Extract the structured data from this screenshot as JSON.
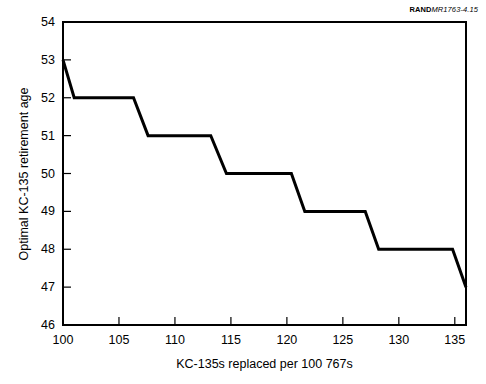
{
  "figure_id": {
    "brand": "RAND",
    "number": "MR1763-4.15"
  },
  "chart_data": {
    "type": "line",
    "title": "",
    "subtitle": "",
    "xlabel": "KC-135s replaced per 100 767s",
    "ylabel": "Optimal KC-135 retirement age",
    "xlim": [
      100,
      136
    ],
    "ylim": [
      46,
      54
    ],
    "xticks": [
      100,
      105,
      110,
      115,
      120,
      125,
      130,
      135
    ],
    "yticks": [
      46,
      47,
      48,
      49,
      50,
      51,
      52,
      53,
      54
    ],
    "xtick_labels": [
      "100",
      "105",
      "110",
      "115",
      "120",
      "125",
      "130",
      "135"
    ],
    "ytick_labels": [
      "46",
      "47",
      "48",
      "49",
      "50",
      "51",
      "52",
      "53",
      "54"
    ],
    "grid": false,
    "legend": null,
    "series": [
      {
        "name": "Optimal KC-135 retirement age",
        "color": "#000000",
        "x": [
          100.0,
          101.0,
          106.3,
          107.6,
          113.2,
          114.6,
          120.4,
          121.6,
          127.0,
          128.2,
          134.8,
          136.0
        ],
        "y": [
          53,
          52,
          52,
          51,
          51,
          50,
          50,
          49,
          49,
          48,
          48,
          47
        ]
      }
    ],
    "steps": [
      {
        "value": 53,
        "x_start": 100.0,
        "x_end": 100.0
      },
      {
        "value": 52,
        "x_start": 101.0,
        "x_end": 106.3
      },
      {
        "value": 51,
        "x_start": 107.6,
        "x_end": 113.2
      },
      {
        "value": 50,
        "x_start": 114.6,
        "x_end": 120.4
      },
      {
        "value": 49,
        "x_start": 121.6,
        "x_end": 127.0
      },
      {
        "value": 48,
        "x_start": 128.2,
        "x_end": 134.8
      },
      {
        "value": 47,
        "x_start": 136.0,
        "x_end": 136.0
      }
    ]
  },
  "colors": {
    "line": "#000000",
    "axis": "#000000",
    "background": "#ffffff"
  }
}
